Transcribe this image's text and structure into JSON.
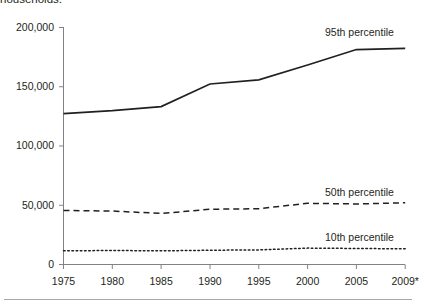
{
  "caption": {
    "clipped_text": "households."
  },
  "chart_data": {
    "type": "line",
    "title": "",
    "subtitle": "",
    "xlabel": "",
    "ylabel": "",
    "x": [
      1975,
      1980,
      1985,
      1990,
      1995,
      2000,
      2005,
      2009
    ],
    "xtick_labels": [
      "1975",
      "1980",
      "1985",
      "1990",
      "1995",
      "2000",
      "2005",
      "2009*"
    ],
    "ytick_labels": [
      "0",
      "50,000",
      "100,000",
      "150,000",
      "200,000"
    ],
    "ytick_values": [
      0,
      50000,
      100000,
      150000,
      200000
    ],
    "ylim": [
      0,
      200000
    ],
    "xlim": [
      1975,
      2009
    ],
    "grid": false,
    "legend_position": "inline-right",
    "series": [
      {
        "name": "95th percentile",
        "style": "solid",
        "color": "#231f20",
        "values": [
          127000,
          129500,
          133000,
          152000,
          155500,
          168000,
          181000,
          182000
        ]
      },
      {
        "name": "50th percentile",
        "style": "dashed",
        "color": "#231f20",
        "values": [
          45500,
          45000,
          43000,
          46500,
          47000,
          51500,
          51000,
          52000
        ]
      },
      {
        "name": "10th percentile",
        "style": "dotted",
        "color": "#231f20",
        "values": [
          11500,
          11800,
          11500,
          12000,
          12300,
          13800,
          13500,
          13200
        ]
      }
    ],
    "annotations": [
      {
        "text": "95th percentile",
        "series": "95th percentile"
      },
      {
        "text": "50th percentile",
        "series": "50th percentile"
      },
      {
        "text": "10th percentile",
        "series": "10th percentile"
      }
    ]
  }
}
